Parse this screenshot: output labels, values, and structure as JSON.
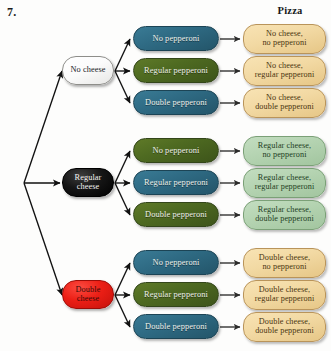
{
  "page": {
    "problem_number": "7.",
    "background_color": "#fdfdfc"
  },
  "headers": {
    "outcome_column": "Pizza"
  },
  "diagram": {
    "type": "probability-tree",
    "stage1_label": "cheese",
    "stage2_label": "pepperoni",
    "branches": [
      {
        "cheese": "No cheese",
        "cheese_style": "white",
        "children": [
          {
            "pepperoni": "No pepperoni",
            "pepperoni_color": "teal",
            "outcome_line1": "No cheese,",
            "outcome_line2": "no pepperoni",
            "outcome_color": "tan"
          },
          {
            "pepperoni": "Regular pepperoni",
            "pepperoni_color": "green",
            "outcome_line1": "No cheese,",
            "outcome_line2": "regular pepperoni",
            "outcome_color": "tan"
          },
          {
            "pepperoni": "Double pepperoni",
            "pepperoni_color": "teal",
            "outcome_line1": "No cheese,",
            "outcome_line2": "double pepperoni",
            "outcome_color": "tan"
          }
        ]
      },
      {
        "cheese": "Regular cheese",
        "cheese_line1": "Regular",
        "cheese_line2": "cheese",
        "cheese_style": "black",
        "children": [
          {
            "pepperoni": "No pepperoni",
            "pepperoni_color": "green",
            "outcome_line1": "Regular cheese,",
            "outcome_line2": "no pepperoni",
            "outcome_color": "green"
          },
          {
            "pepperoni": "Regular pepperoni",
            "pepperoni_color": "teal",
            "outcome_line1": "Regular cheese,",
            "outcome_line2": "regular pepperoni",
            "outcome_color": "green"
          },
          {
            "pepperoni": "Double pepperoni",
            "pepperoni_color": "green",
            "outcome_line1": "Regular cheese,",
            "outcome_line2": "double pepperoni",
            "outcome_color": "green"
          }
        ]
      },
      {
        "cheese": "Double cheese",
        "cheese_line1": "Double",
        "cheese_line2": "cheese",
        "cheese_style": "red",
        "children": [
          {
            "pepperoni": "No pepperoni",
            "pepperoni_color": "teal",
            "outcome_line1": "Double cheese,",
            "outcome_line2": "no pepperoni",
            "outcome_color": "tan"
          },
          {
            "pepperoni": "Regular pepperoni",
            "pepperoni_color": "green",
            "outcome_line1": "Double cheese,",
            "outcome_line2": "regular pepperoni",
            "outcome_color": "tan"
          },
          {
            "pepperoni": "Double pepperoni",
            "pepperoni_color": "teal",
            "outcome_line1": "Double cheese,",
            "outcome_line2": "double pepperoni",
            "outcome_color": "tan"
          }
        ]
      }
    ]
  },
  "colors": {
    "teal_node": "#2f6b84",
    "green_node": "#4e6a21",
    "tan_outcome": "#f2d9a3",
    "green_outcome": "#b4d3b1",
    "red_cheese": "#ec1f16",
    "black_cheese": "#161616",
    "white_cheese": "#ffffff",
    "arrow": "#111111"
  }
}
